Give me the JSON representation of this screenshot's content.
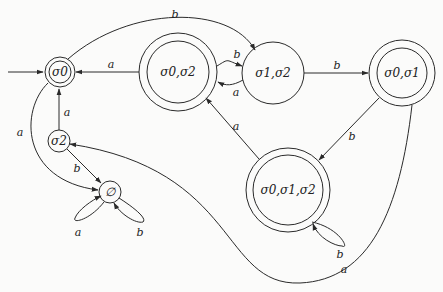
{
  "diagram": {
    "type": "deterministic finite automaton (subset construction)",
    "start_state": "σ0",
    "states": [
      {
        "id": "s0",
        "label": "σ0",
        "accepting": true
      },
      {
        "id": "s02",
        "label": "σ0,σ2",
        "accepting": true
      },
      {
        "id": "s12",
        "label": "σ1,σ2",
        "accepting": false
      },
      {
        "id": "s01",
        "label": "σ0,σ1",
        "accepting": true
      },
      {
        "id": "s012",
        "label": "σ0,σ1,σ2",
        "accepting": true
      },
      {
        "id": "s2",
        "label": "σ2",
        "accepting": false
      },
      {
        "id": "empty",
        "label": "∅",
        "accepting": false
      }
    ],
    "transitions": [
      {
        "from": "σ0",
        "to": "σ1,σ2",
        "label": "b"
      },
      {
        "from": "σ0",
        "to": "∅",
        "label": "a"
      },
      {
        "from": "σ0,σ2",
        "to": "σ0",
        "label": "a"
      },
      {
        "from": "σ0,σ2",
        "to": "σ1,σ2",
        "label": "b"
      },
      {
        "from": "σ1,σ2",
        "to": "σ0,σ2",
        "label": "a"
      },
      {
        "from": "σ1,σ2",
        "to": "σ0,σ1",
        "label": "b"
      },
      {
        "from": "σ0,σ1",
        "to": "σ0,σ1,σ2",
        "label": "b"
      },
      {
        "from": "σ0,σ1",
        "to": "σ2",
        "label": "a"
      },
      {
        "from": "σ0,σ1,σ2",
        "to": "σ0,σ2",
        "label": "a"
      },
      {
        "from": "σ0,σ1,σ2",
        "to": "σ0,σ1,σ2",
        "label": "b"
      },
      {
        "from": "σ2",
        "to": "σ0",
        "label": "a"
      },
      {
        "from": "σ2",
        "to": "∅",
        "label": "b"
      },
      {
        "from": "∅",
        "to": "∅",
        "label": "a"
      },
      {
        "from": "∅",
        "to": "∅",
        "label": "b"
      }
    ],
    "labels": {
      "s0": "σ0",
      "s02": "σ0,σ2",
      "s12": "σ1,σ2",
      "s01": "σ0,σ1",
      "s012": "σ0,σ1,σ2",
      "s2": "σ2",
      "empty": "∅",
      "e_s0_s12": "b",
      "e_s0_empty": "a",
      "e_s02_s0": "a",
      "e_s02_s12": "b",
      "e_s12_s02": "a",
      "e_s12_s01": "b",
      "e_s01_s012": "b",
      "e_s01_s2": "a",
      "e_s012_s02": "a",
      "e_s012_self": "b",
      "e_s2_s0": "a",
      "e_s2_empty": "b",
      "e_empty_self_a": "a",
      "e_empty_self_b": "b"
    }
  }
}
